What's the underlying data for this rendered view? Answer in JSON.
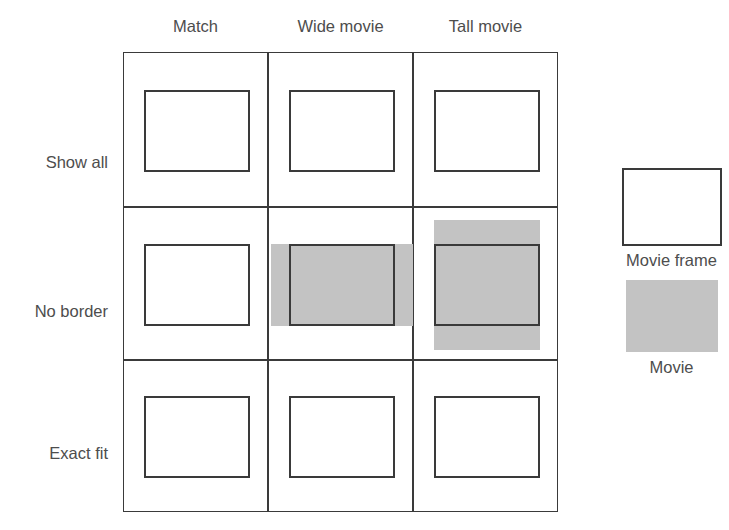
{
  "diagram": {
    "colors": {
      "movie_fill": "#c3c3c3",
      "frame_border": "#3a3a3a",
      "text": "#4d4d4d",
      "background": "#ffffff"
    },
    "column_headers": [
      {
        "id": "match",
        "label": "Match"
      },
      {
        "id": "wide-movie",
        "label": "Wide movie"
      },
      {
        "id": "tall-movie",
        "label": "Tall movie"
      }
    ],
    "row_labels": [
      {
        "id": "show-all",
        "label": "Show all"
      },
      {
        "id": "no-border",
        "label": "No border"
      },
      {
        "id": "exact-fit",
        "label": "Exact fit"
      }
    ],
    "cells": [
      {
        "row": "Show all",
        "column": "Match",
        "description": "Movie exactly fills the frame; no bars, no overflow.",
        "fit": "fill"
      },
      {
        "row": "Show all",
        "column": "Wide movie",
        "description": "Wide movie letterboxed: white bars at top and bottom inside the frame.",
        "fit": "letterbox"
      },
      {
        "row": "Show all",
        "column": "Tall movie",
        "description": "Tall movie pillarboxed: white bars at left and right inside the frame.",
        "fit": "pillarbox"
      },
      {
        "row": "No border",
        "column": "Match",
        "description": "Movie exactly fills the frame; no bars, no overflow.",
        "fit": "fill"
      },
      {
        "row": "No border",
        "column": "Wide movie",
        "description": "Wide movie overflows horizontally past the left and right frame edges.",
        "fit": "overflow-horizontal"
      },
      {
        "row": "No border",
        "column": "Tall movie",
        "description": "Tall movie overflows vertically past the top and bottom frame edges.",
        "fit": "overflow-vertical"
      },
      {
        "row": "Exact fit",
        "column": "Match",
        "description": "Movie stretched to exactly fill the frame.",
        "fit": "fill"
      },
      {
        "row": "Exact fit",
        "column": "Wide movie",
        "description": "Movie stretched to exactly fill the frame.",
        "fit": "fill"
      },
      {
        "row": "Exact fit",
        "column": "Tall movie",
        "description": "Movie stretched to exactly fill the frame.",
        "fit": "fill"
      }
    ],
    "legend": {
      "frame_label": "Movie frame",
      "movie_label": "Movie"
    }
  }
}
